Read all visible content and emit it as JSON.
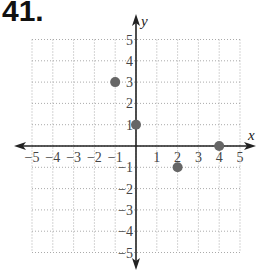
{
  "problem_number": "41.",
  "chart_data": {
    "type": "scatter",
    "title": "",
    "xlabel": "x",
    "ylabel": "y",
    "xlim": [
      -5,
      5
    ],
    "ylim": [
      -5,
      5
    ],
    "grid": true,
    "x_ticks": [
      "-5",
      "-4",
      "-3",
      "-2",
      "-1",
      "1",
      "2",
      "3",
      "4",
      "5"
    ],
    "y_ticks": [
      "5",
      "4",
      "3",
      "2",
      "1",
      "-1",
      "-2",
      "-3",
      "-4",
      "-5"
    ],
    "points": [
      {
        "x": -1,
        "y": 3
      },
      {
        "x": 0,
        "y": 1
      },
      {
        "x": 2,
        "y": -1
      },
      {
        "x": 4,
        "y": 0
      }
    ],
    "point_color": "#666666",
    "axis_color": "#222222",
    "grid_color": "#aaaaaa"
  }
}
